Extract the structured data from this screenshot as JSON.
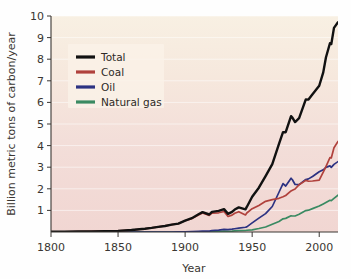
{
  "figure": {
    "name": "global-fossil-fuel-carbon-emissions-chart",
    "background_color": "#ffffff"
  },
  "axes": {
    "x": {
      "label": "Year",
      "ticks": [
        1800,
        1850,
        1900,
        1950,
        2000
      ],
      "tick_labels": [
        "1800",
        "1850",
        "1900",
        "1950",
        "2000"
      ],
      "range": [
        1800,
        2014
      ]
    },
    "y": {
      "label": "Billion metric tons of carbon/year",
      "ticks": [
        1,
        2,
        3,
        4,
        5,
        6,
        7,
        8,
        9,
        10
      ],
      "tick_labels": [
        "1",
        "2",
        "3",
        "4",
        "5",
        "6",
        "7",
        "8",
        "9",
        "10"
      ],
      "range": [
        0,
        10
      ]
    }
  },
  "legend": {
    "position": "upper-left-inside",
    "entries": [
      {
        "label": "Total",
        "color": "#111111"
      },
      {
        "label": "Coal",
        "color": "#b0413c"
      },
      {
        "label": "Oil",
        "color": "#2c3282"
      },
      {
        "label": "Natural gas",
        "color": "#3a8a62"
      }
    ]
  },
  "plot_area": {
    "gradient_top_color": "#f7eee1",
    "gradient_bottom_color": "#f2d8d4",
    "gridline_color": "#ffffff"
  },
  "chart_data": {
    "type": "line",
    "title": "",
    "subtitle": "",
    "xlabel": "Year",
    "ylabel": "Billion metric tons of carbon/year",
    "xlim": [
      1800,
      2014
    ],
    "ylim": [
      0,
      10
    ],
    "grid": true,
    "legend_position": "upper left",
    "x": [
      1800,
      1810,
      1820,
      1830,
      1840,
      1850,
      1860,
      1870,
      1875,
      1880,
      1885,
      1890,
      1895,
      1900,
      1905,
      1910,
      1913,
      1918,
      1920,
      1925,
      1929,
      1932,
      1935,
      1937,
      1940,
      1945,
      1946,
      1950,
      1955,
      1960,
      1965,
      1970,
      1973,
      1975,
      1979,
      1980,
      1982,
      1985,
      1990,
      1992,
      1995,
      2000,
      2003,
      2005,
      2008,
      2009,
      2011,
      2014
    ],
    "series": [
      {
        "name": "Total",
        "color": "#111111",
        "values": [
          0.01,
          0.01,
          0.02,
          0.03,
          0.04,
          0.05,
          0.09,
          0.15,
          0.19,
          0.24,
          0.28,
          0.34,
          0.39,
          0.53,
          0.64,
          0.82,
          0.92,
          0.81,
          0.93,
          0.98,
          1.06,
          0.84,
          0.93,
          1.04,
          1.14,
          1.05,
          1.16,
          1.63,
          2.05,
          2.59,
          3.14,
          4.08,
          4.62,
          4.62,
          5.36,
          5.3,
          5.09,
          5.27,
          6.14,
          6.13,
          6.38,
          6.77,
          7.39,
          8.08,
          8.74,
          8.7,
          9.45,
          9.71
        ]
      },
      {
        "name": "Coal",
        "color": "#b0413c",
        "values": [
          0.01,
          0.01,
          0.02,
          0.03,
          0.04,
          0.05,
          0.09,
          0.15,
          0.19,
          0.24,
          0.28,
          0.34,
          0.39,
          0.52,
          0.62,
          0.79,
          0.88,
          0.77,
          0.87,
          0.89,
          0.95,
          0.72,
          0.78,
          0.87,
          0.94,
          0.79,
          0.88,
          1.08,
          1.23,
          1.42,
          1.5,
          1.56,
          1.63,
          1.69,
          1.9,
          1.93,
          1.99,
          2.19,
          2.39,
          2.35,
          2.36,
          2.4,
          2.77,
          3.03,
          3.44,
          3.43,
          3.9,
          4.19
        ]
      },
      {
        "name": "Oil",
        "color": "#2c3282",
        "values": [
          0.0,
          0.0,
          0.0,
          0.0,
          0.0,
          0.0,
          0.0,
          0.0,
          0.0,
          0.0,
          0.0,
          0.0,
          0.01,
          0.01,
          0.02,
          0.03,
          0.04,
          0.04,
          0.06,
          0.09,
          0.12,
          0.11,
          0.13,
          0.15,
          0.18,
          0.22,
          0.24,
          0.42,
          0.64,
          0.85,
          1.18,
          1.84,
          2.24,
          2.13,
          2.49,
          2.42,
          2.2,
          2.19,
          2.43,
          2.46,
          2.57,
          2.79,
          2.88,
          2.99,
          3.06,
          2.99,
          3.13,
          3.26
        ]
      },
      {
        "name": "Natural gas",
        "color": "#3a8a62",
        "values": [
          0.0,
          0.0,
          0.0,
          0.0,
          0.0,
          0.0,
          0.0,
          0.0,
          0.0,
          0.0,
          0.0,
          0.0,
          0.0,
          0.0,
          0.0,
          0.01,
          0.01,
          0.01,
          0.02,
          0.03,
          0.04,
          0.03,
          0.04,
          0.05,
          0.06,
          0.07,
          0.08,
          0.1,
          0.16,
          0.23,
          0.36,
          0.49,
          0.61,
          0.63,
          0.75,
          0.74,
          0.74,
          0.82,
          0.99,
          1.01,
          1.08,
          1.2,
          1.3,
          1.37,
          1.47,
          1.45,
          1.56,
          1.71
        ]
      }
    ]
  }
}
